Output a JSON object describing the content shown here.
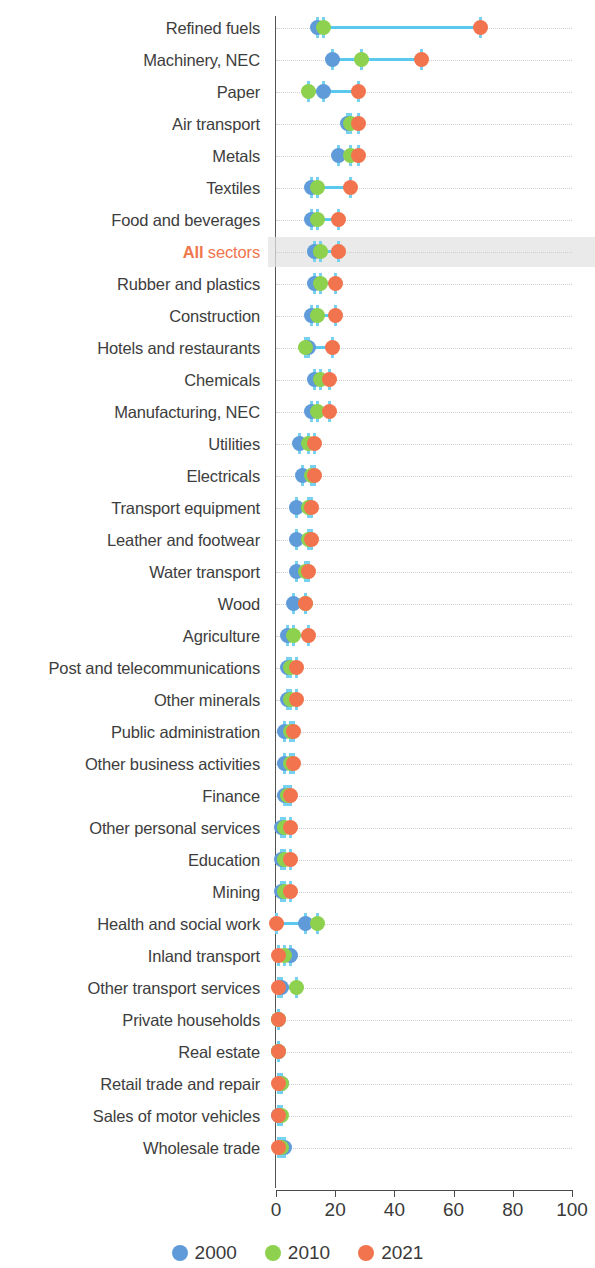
{
  "chart_data": {
    "type": "scatter",
    "title": "",
    "xlabel": "",
    "ylabel": "",
    "xlim": [
      0,
      100
    ],
    "xticks": [
      0,
      20,
      40,
      60,
      80,
      100
    ],
    "grid": true,
    "legend_position": "bottom",
    "series_names": [
      "2000",
      "2010",
      "2021"
    ],
    "series_colors": {
      "2000": "#5e9bd8",
      "2010": "#8ed14f",
      "2021": "#f2744e"
    },
    "connector_color": "#5bc8ee",
    "highlight_row": "All sectors",
    "highlight_color": "#f0764d",
    "categories": [
      "Refined fuels",
      "Machinery, NEC",
      "Paper",
      "Air transport",
      "Metals",
      "Textiles",
      "Food and beverages",
      "All sectors",
      "Rubber and plastics",
      "Construction",
      "Hotels and restaurants",
      "Chemicals",
      "Manufacturing, NEC",
      "Utilities",
      "Electricals",
      "Transport equipment",
      "Leather and footwear",
      "Water transport",
      "Wood",
      "Agriculture",
      "Post and telecommunications",
      "Other minerals",
      "Public administration",
      "Other business activities",
      "Finance",
      "Other personal services",
      "Education",
      "Mining",
      "Health and social work",
      "Inland transport",
      "Other transport services",
      "Private households",
      "Real estate",
      "Retail trade and repair",
      "Sales of motor vehicles",
      "Wholesale trade"
    ],
    "series": [
      {
        "name": "2000",
        "values": [
          14,
          19,
          16,
          24,
          21,
          12,
          12,
          13,
          13,
          12,
          11,
          13,
          12,
          8,
          9,
          7,
          7,
          7,
          6,
          4,
          4,
          4,
          3,
          3,
          3,
          2,
          2,
          2,
          10,
          5,
          2,
          1,
          1,
          2,
          1,
          3
        ]
      },
      {
        "name": "2010",
        "values": [
          16,
          29,
          11,
          25,
          25,
          14,
          14,
          15,
          15,
          14,
          10,
          15,
          14,
          11,
          12,
          11,
          11,
          10,
          10,
          6,
          5,
          5,
          5,
          5,
          4,
          3,
          3,
          3,
          14,
          3,
          7,
          1,
          1,
          2,
          2,
          2
        ]
      },
      {
        "name": "2021",
        "values": [
          69,
          49,
          28,
          28,
          28,
          25,
          21,
          21,
          20,
          20,
          19,
          18,
          18,
          13,
          13,
          12,
          12,
          11,
          10,
          11,
          7,
          7,
          6,
          6,
          5,
          5,
          5,
          5,
          0,
          1,
          1,
          1,
          1,
          1,
          1,
          1
        ]
      }
    ]
  },
  "legend": {
    "items": [
      {
        "label": "2000",
        "color": "#5e9bd8"
      },
      {
        "label": "2010",
        "color": "#8ed14f"
      },
      {
        "label": "2021",
        "color": "#f2744e"
      }
    ]
  },
  "axis": {
    "tick_labels": [
      "0",
      "20",
      "40",
      "60",
      "80",
      "100"
    ]
  }
}
